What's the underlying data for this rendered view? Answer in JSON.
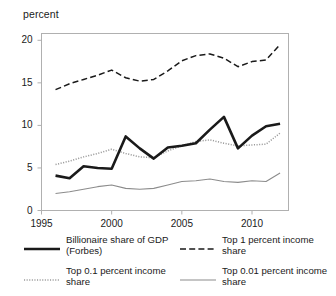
{
  "chart_data": {
    "type": "line",
    "title": "",
    "subtitle": "",
    "xlabel": "",
    "ylabel": "percent",
    "ylabel_position": "top-left",
    "grid": false,
    "legend_position": "bottom",
    "xlim": [
      1995,
      2012.6
    ],
    "ylim": [
      0,
      20.8
    ],
    "xticks": [
      1995,
      2000,
      2005,
      2010
    ],
    "xtick_labels": [
      "1995",
      "2000",
      "2005",
      "2010"
    ],
    "yticks": [
      0,
      5,
      10,
      15,
      20
    ],
    "ytick_labels": [
      "0",
      "5",
      "10",
      "15",
      "20"
    ],
    "x": [
      1996,
      1997,
      1998,
      1999,
      2000,
      2001,
      2002,
      2003,
      2004,
      2005,
      2006,
      2007,
      2008,
      2009,
      2010,
      2011,
      2012
    ],
    "series": [
      {
        "name": "Billionaire share of GDP (Forbes)",
        "style": "solid-thick",
        "color": "#1a1a1a",
        "values": [
          4.1,
          3.8,
          5.2,
          5.0,
          4.9,
          8.7,
          7.3,
          6.1,
          7.4,
          7.6,
          7.9,
          9.5,
          11.0,
          7.3,
          8.8,
          9.9,
          10.2
        ]
      },
      {
        "name": "Top 1 percent income share",
        "style": "dashed",
        "color": "#1a1a1a",
        "values": [
          14.2,
          14.9,
          15.4,
          15.9,
          16.5,
          15.6,
          15.2,
          15.4,
          16.4,
          17.6,
          18.2,
          18.4,
          17.9,
          16.9,
          17.5,
          17.7,
          19.5
        ]
      },
      {
        "name": "Top 0.1 percent income share",
        "style": "dotted",
        "color": "#9a9a9a",
        "values": [
          5.4,
          5.8,
          6.3,
          6.7,
          7.2,
          6.7,
          6.3,
          6.2,
          7.0,
          7.6,
          8.1,
          8.3,
          7.9,
          7.6,
          7.7,
          7.8,
          9.1
        ]
      },
      {
        "name": "Top 0.01 percent income share",
        "style": "solid-thin",
        "color": "#8c8c8c",
        "values": [
          2.0,
          2.2,
          2.5,
          2.8,
          3.0,
          2.6,
          2.5,
          2.6,
          3.0,
          3.4,
          3.5,
          3.7,
          3.4,
          3.3,
          3.5,
          3.4,
          4.4
        ]
      }
    ]
  },
  "legend": {
    "entries": [
      {
        "label": "Billionaire share of GDP (Forbes)",
        "style": "solid-thick",
        "column": "left"
      },
      {
        "label": "Top 0.1 percent income share",
        "style": "dotted",
        "column": "left"
      },
      {
        "label": "Top 1 percent income share",
        "style": "dashed",
        "column": "right"
      },
      {
        "label": "Top 0.01 percent income share",
        "style": "solid-thin",
        "column": "right"
      }
    ]
  }
}
